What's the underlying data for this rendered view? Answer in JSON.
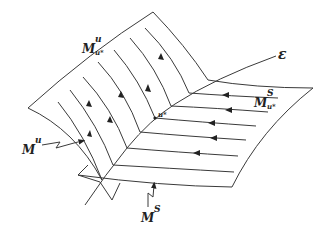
{
  "diagram": {
    "type": "manifold-flow-diagram",
    "colors": {
      "line": "#3a3a3a",
      "background": "#ffffff",
      "text": "#222222"
    },
    "labels": {
      "unstable_manifold_local": {
        "base": "M",
        "sup": "u",
        "sub": "u*"
      },
      "unstable_manifold": {
        "base": "M",
        "sup": "u"
      },
      "stable_manifold_local": {
        "base": "M",
        "sup": "S",
        "sub": "u*"
      },
      "stable_manifold": {
        "base": "M",
        "sup": "S"
      },
      "equilibrium_curve": "ε",
      "point": "u*"
    },
    "flows": {
      "unstable_direction": "up-left along unstable manifold",
      "stable_direction": "leftward along stable manifold toward curve ε"
    }
  }
}
